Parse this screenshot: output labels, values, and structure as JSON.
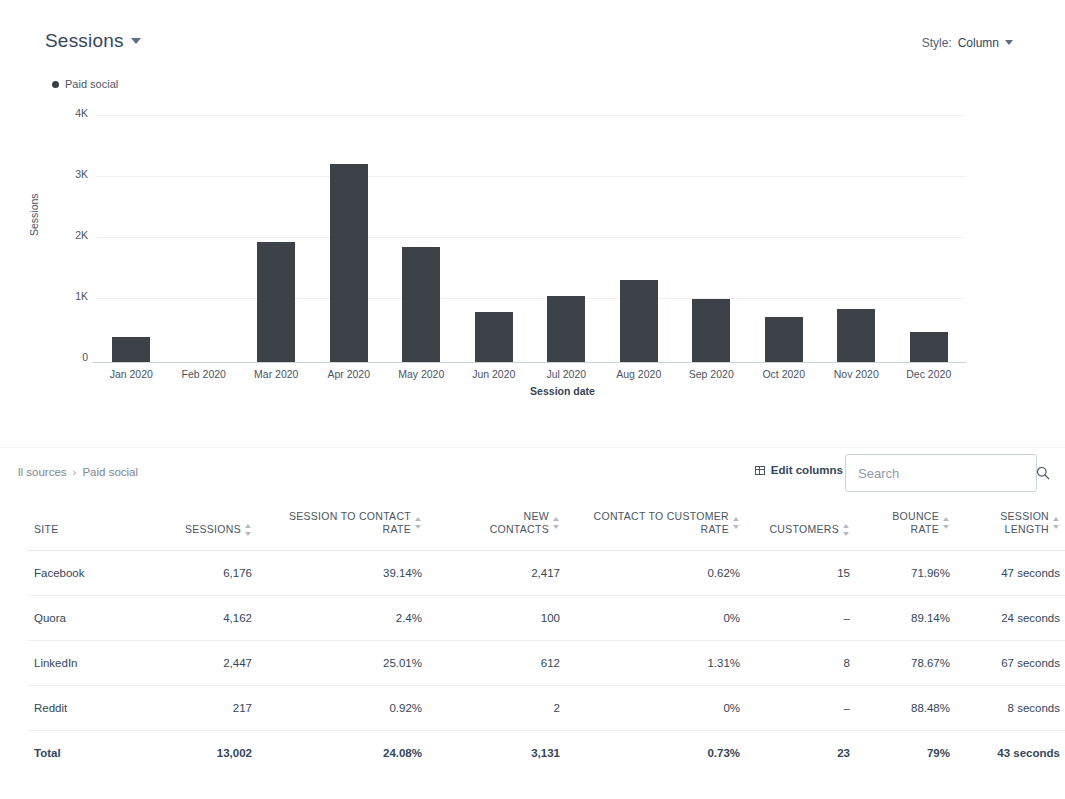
{
  "chart_panel": {
    "title": "Sessions",
    "title_caret_icon": "chevron-down-icon",
    "style_label": "Style:",
    "style_value": "Column",
    "style_caret_icon": "chevron-down-icon",
    "legend": [
      {
        "label": "Paid social",
        "color": "#3b3f45"
      }
    ]
  },
  "chart_data": {
    "type": "bar",
    "title": "Sessions",
    "xlabel": "Session date",
    "ylabel": "Sessions",
    "series_name": "Paid social",
    "bar_color": "#3d4249",
    "grid": true,
    "legend_position": "top-left",
    "ylim": [
      0,
      4000
    ],
    "ytick_values": [
      0,
      1000,
      2000,
      3000,
      4000
    ],
    "ytick_labels": [
      "0",
      "1K",
      "2K",
      "3K",
      "4K"
    ],
    "categories": [
      "Jan 2020",
      "Feb 2020",
      "Mar 2020",
      "Apr 2020",
      "May 2020",
      "Jun 2020",
      "Jul 2020",
      "Aug 2020",
      "Sep 2020",
      "Oct 2020",
      "Nov 2020",
      "Dec 2020"
    ],
    "values": [
      390,
      0,
      1900,
      3140,
      1830,
      790,
      1040,
      1300,
      1000,
      710,
      840,
      470
    ]
  },
  "table_panel": {
    "breadcrumb": {
      "root": "ll sources",
      "separator": "›",
      "current": "Paid social"
    },
    "edit_columns_label": "Edit columns",
    "edit_columns_icon": "columns-icon",
    "search": {
      "placeholder": "Search",
      "value": "",
      "icon": "search-icon"
    },
    "columns": [
      {
        "label": "SITE",
        "sortable": false,
        "align": "left"
      },
      {
        "label": "SESSIONS",
        "sortable": true,
        "align": "right"
      },
      {
        "label": "SESSION TO CONTACT RATE",
        "sortable": true,
        "align": "right"
      },
      {
        "label": "NEW CONTACTS",
        "sortable": true,
        "align": "right"
      },
      {
        "label": "CONTACT TO CUSTOMER RATE",
        "sortable": true,
        "align": "right"
      },
      {
        "label": "CUSTOMERS",
        "sortable": true,
        "align": "right"
      },
      {
        "label": "BOUNCE RATE",
        "sortable": true,
        "align": "right"
      },
      {
        "label": "SESSION LENGTH",
        "sortable": true,
        "align": "right"
      }
    ],
    "column_lines": [
      [
        "SITE",
        ""
      ],
      [
        "SESSIONS",
        ""
      ],
      [
        "SESSION TO CONTACT",
        "RATE"
      ],
      [
        "NEW",
        "CONTACTS"
      ],
      [
        "CONTACT TO CUSTOMER",
        "RATE"
      ],
      [
        "CUSTOMERS",
        ""
      ],
      [
        "BOUNCE",
        "RATE"
      ],
      [
        "SESSION",
        "LENGTH"
      ]
    ],
    "rows": [
      {
        "site": "Facebook",
        "sessions": "6,176",
        "session_to_contact_rate": "39.14%",
        "new_contacts": "2,417",
        "contact_to_customer_rate": "0.62%",
        "customers": "15",
        "bounce_rate": "71.96%",
        "session_length": "47 seconds"
      },
      {
        "site": "Quora",
        "sessions": "4,162",
        "session_to_contact_rate": "2.4%",
        "new_contacts": "100",
        "contact_to_customer_rate": "0%",
        "customers": "–",
        "bounce_rate": "89.14%",
        "session_length": "24 seconds"
      },
      {
        "site": "LinkedIn",
        "sessions": "2,447",
        "session_to_contact_rate": "25.01%",
        "new_contacts": "612",
        "contact_to_customer_rate": "1.31%",
        "customers": "8",
        "bounce_rate": "78.67%",
        "session_length": "67 seconds"
      },
      {
        "site": "Reddit",
        "sessions": "217",
        "session_to_contact_rate": "0.92%",
        "new_contacts": "2",
        "contact_to_customer_rate": "0%",
        "customers": "–",
        "bounce_rate": "88.48%",
        "session_length": "8 seconds"
      }
    ],
    "total_row": {
      "site": "Total",
      "sessions": "13,002",
      "session_to_contact_rate": "24.08%",
      "new_contacts": "3,131",
      "contact_to_customer_rate": "0.73%",
      "customers": "23",
      "bounce_rate": "79%",
      "session_length": "43 seconds"
    }
  }
}
